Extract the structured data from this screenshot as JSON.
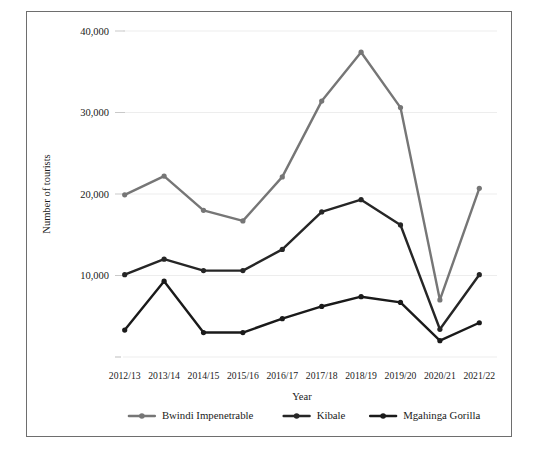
{
  "chart_data": {
    "type": "line",
    "title": "",
    "xlabel": "Year",
    "ylabel": "Number of tourists",
    "categories": [
      "2012/13",
      "2013/14",
      "2014/15",
      "2015/16",
      "2016/17",
      "2017/18",
      "2018/19",
      "2019/20",
      "2020/21",
      "2021/22"
    ],
    "ylim": [
      0,
      40000
    ],
    "yticks": [
      10000,
      20000,
      30000,
      40000
    ],
    "ytick_labels": [
      "10,000",
      "20,000",
      "30,000",
      "40,000"
    ],
    "grid": true,
    "legend_position": "bottom",
    "series": [
      {
        "name": "Bwindi Impenetrable",
        "color": "#767676",
        "values": [
          19900,
          22200,
          18000,
          16700,
          22100,
          31400,
          37400,
          30600,
          7000,
          20700
        ]
      },
      {
        "name": "Kibale",
        "color": "#262626",
        "values": [
          10100,
          12000,
          10600,
          10600,
          13200,
          17800,
          19300,
          16200,
          3400,
          10100
        ]
      },
      {
        "name": "Mgahinga Gorilla",
        "color": "#1a1a1a",
        "values": [
          3300,
          9300,
          3000,
          3000,
          4700,
          6200,
          7400,
          6700,
          2000,
          4200
        ]
      }
    ]
  },
  "figure": {
    "border_color": "#6e6e6e",
    "background": "#ffffff",
    "gridline_color": "#ededed"
  }
}
